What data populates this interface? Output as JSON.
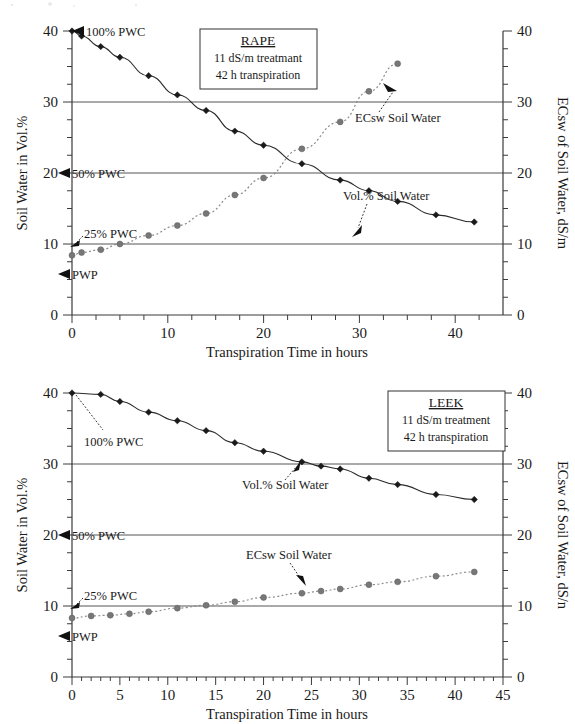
{
  "figure": {
    "width": 575,
    "height": 724,
    "background": "#ffffff",
    "panels": [
      "top",
      "bottom"
    ]
  },
  "colors": {
    "vol_series": "#1a1a1a",
    "ec_series": "#7a7a7a",
    "axis": "#3a3a3a",
    "gridline": "#555555",
    "text": "#1a1a1a",
    "box_fill": "#ffffff",
    "box_stroke": "#333333"
  },
  "common": {
    "xlabel": "Transpiration Time in hours",
    "ylabel_left": "Soil Water in Vol.%",
    "series_label_vol": "Vol.% Soil Water",
    "series_label_ec": "ECsw Soil Water",
    "marker_vol": "black-diamond",
    "marker_ec": "gray-circle",
    "reference_lines": [
      "100% PWC",
      "50% PWC",
      "25% PWC",
      "PWP"
    ]
  },
  "chart_data": [
    {
      "id": "rape",
      "type": "line",
      "title": "RAPE",
      "subtitle_lines": [
        "11 dS/m treatmant",
        "42 h transpiration"
      ],
      "xlabel": "Transpiration Time in hours",
      "ylabel": "Soil Water in Vol.%",
      "ylabel_right": "ECsw of Soil Water, dS/m",
      "xlim": [
        0,
        45
      ],
      "ylim": [
        0,
        40
      ],
      "ylim_right": [
        0,
        40
      ],
      "xticks": [
        0,
        10,
        20,
        30,
        40
      ],
      "xticks_minor_step": 2.5,
      "yticks": [
        0,
        10,
        20,
        30,
        40
      ],
      "yticks_minor_step": 2.5,
      "grid": "horizontal-at-10-20-30",
      "legend": "inline-annotations",
      "annotations": [
        {
          "text": "100% PWC",
          "marker": "left-triangle",
          "y_value": 40,
          "style": "triangle-then-text"
        },
        {
          "text": "50% PWC",
          "marker": "left-triangle",
          "y_value": 20,
          "style": "triangle-then-text"
        },
        {
          "text": "25% PWC",
          "marker": "arrow",
          "y_value": 10,
          "style": "text-with-arrow"
        },
        {
          "text": "PWP",
          "marker": "left-triangle",
          "y_value": 6.1,
          "style": "triangle-then-text"
        },
        {
          "text": "ECsw Soil Water",
          "marker": "arrow-to-curve",
          "points_at": [
            31.5,
            32.3
          ]
        },
        {
          "text": "Vol.% Soil Water",
          "marker": "arrow-to-curve",
          "points_at": [
            30.5,
            11.3
          ]
        }
      ],
      "series": [
        {
          "name": "Vol.% Soil Water",
          "axis": "left",
          "marker": "black-diamond",
          "linestyle": "solid",
          "x": [
            0,
            1,
            3,
            5,
            8,
            11,
            14,
            17,
            20,
            24,
            28,
            31,
            34,
            38,
            42
          ],
          "values": [
            40.0,
            39.3,
            37.8,
            36.3,
            33.7,
            31.0,
            28.8,
            25.9,
            23.9,
            21.3,
            19.0,
            17.5,
            16.0,
            14.1,
            13.1
          ]
        },
        {
          "name": "ECsw Soil Water",
          "axis": "right",
          "marker": "gray-circle",
          "linestyle": "dotted",
          "x": [
            0,
            1,
            3,
            5,
            8,
            11,
            14,
            17,
            20,
            24,
            28,
            31,
            34
          ],
          "values": [
            8.4,
            8.8,
            9.2,
            10.0,
            11.2,
            12.6,
            14.3,
            16.9,
            19.3,
            23.4,
            27.2,
            31.5,
            35.4
          ]
        }
      ],
      "series_left_readout": {
        "note": "Vol.% curve read on left axis",
        "x": [
          0,
          1,
          3,
          5,
          8,
          11,
          14,
          17,
          20,
          24,
          28,
          31,
          34,
          38,
          42
        ],
        "vol_percent": [
          40.0,
          39.3,
          37.8,
          36.3,
          33.7,
          31.0,
          28.8,
          25.9,
          23.9,
          21.3,
          19.0,
          17.5,
          16.0,
          14.1,
          13.1
        ]
      }
    },
    {
      "id": "leek",
      "type": "line",
      "title": "LEEK",
      "subtitle_lines": [
        "11 dS/m treatment",
        "42 h transpiration"
      ],
      "xlabel": "Transpiration Time in hours",
      "ylabel": "Soil Water in Vol.%",
      "ylabel_right": "ECsw of Soil Water, dS/n",
      "xlim": [
        0,
        45
      ],
      "ylim": [
        0,
        40
      ],
      "ylim_right": [
        0,
        40
      ],
      "xticks": [
        0,
        5,
        10,
        15,
        20,
        25,
        30,
        35,
        40,
        45
      ],
      "xticks_minor_step": 1,
      "yticks": [
        0,
        10,
        20,
        30,
        40
      ],
      "yticks_minor_step": 2.5,
      "grid": "horizontal-at-10-20-30",
      "legend": "inline-annotations",
      "annotations": [
        {
          "text": "100% PWC",
          "marker": "arrow",
          "y_value": 40,
          "style": "text-with-arrow"
        },
        {
          "text": "50% PWC",
          "marker": "left-triangle",
          "y_value": 20,
          "style": "triangle-then-text"
        },
        {
          "text": "25% PWC",
          "marker": "arrow",
          "y_value": 10,
          "style": "text-with-arrow"
        },
        {
          "text": "PWP",
          "marker": "left-triangle",
          "y_value": 6.1,
          "style": "triangle-then-text"
        },
        {
          "text": "Vol.% Soil Water",
          "marker": "arrow-to-curve",
          "points_at": [
            26,
            29.7
          ]
        },
        {
          "text": "ECsw Soil Water",
          "marker": "arrow-to-curve",
          "points_at": [
            26,
            12.1
          ]
        }
      ],
      "series": [
        {
          "name": "Vol.% Soil Water",
          "axis": "left",
          "marker": "black-diamond",
          "linestyle": "solid",
          "x": [
            0,
            3,
            5,
            8,
            11,
            14,
            17,
            20,
            24,
            26,
            28,
            31,
            34,
            38,
            42
          ],
          "values": [
            40.0,
            39.8,
            38.8,
            37.3,
            36.1,
            34.7,
            33.0,
            31.8,
            30.3,
            29.7,
            29.3,
            28.0,
            27.1,
            25.7,
            25.0
          ]
        },
        {
          "name": "ECsw Soil Water",
          "axis": "right",
          "marker": "gray-circle",
          "linestyle": "dotted",
          "x": [
            0,
            2,
            4,
            6,
            8,
            11,
            14,
            17,
            20,
            24,
            26,
            28,
            31,
            34,
            38,
            42
          ],
          "values": [
            8.3,
            8.6,
            8.7,
            8.9,
            9.2,
            9.7,
            10.1,
            10.6,
            11.2,
            11.8,
            12.1,
            12.4,
            13.0,
            13.4,
            14.2,
            14.8
          ]
        }
      ],
      "series_left_readout": {
        "note": "Vol.% curve read on left axis",
        "x": [
          0,
          3,
          5,
          8,
          11,
          14,
          17,
          20,
          24,
          26,
          28,
          31,
          34,
          38,
          42
        ],
        "vol_percent": [
          40.0,
          39.8,
          38.8,
          37.3,
          36.1,
          34.7,
          33.0,
          31.8,
          30.3,
          29.7,
          29.3,
          28.0,
          27.1,
          25.7,
          25.0
        ]
      }
    }
  ]
}
